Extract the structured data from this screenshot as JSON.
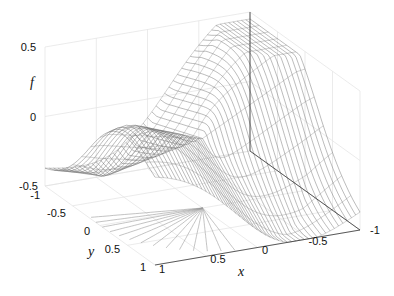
{
  "chart_data": {
    "type": "surface",
    "style": "mesh",
    "title": "",
    "xlabel": "x",
    "ylabel": "y",
    "zlabel": "f",
    "xlim": [
      -1,
      1
    ],
    "ylim": [
      -1,
      1
    ],
    "zlim": [
      -0.5,
      0.5
    ],
    "x_ticks": [
      "-1",
      "-0.5",
      "0",
      "0.5",
      "1"
    ],
    "y_ticks": [
      "-1",
      "-0.5",
      "0",
      "0.5",
      "1"
    ],
    "z_ticks": [
      "-0.5",
      "0",
      "0.5"
    ],
    "grid": true,
    "line_color": "#555555"
  },
  "labels": {
    "x": "x",
    "y": "y",
    "z": "f"
  },
  "ticks": {
    "z": [
      {
        "text": "0.5",
        "x": 36,
        "y": 51
      },
      {
        "text": "0",
        "x": 36,
        "y": 121
      },
      {
        "text": "-0.5",
        "x": 38,
        "y": 190
      }
    ],
    "y": [
      {
        "text": "-1",
        "x": 40,
        "y": 199
      },
      {
        "text": "-0.5",
        "x": 66,
        "y": 217
      },
      {
        "text": "0",
        "x": 90,
        "y": 235
      },
      {
        "text": "0.5",
        "x": 120,
        "y": 253
      },
      {
        "text": "1",
        "x": 146,
        "y": 271
      }
    ],
    "x": [
      {
        "text": "1",
        "x": 162,
        "y": 273
      },
      {
        "text": "0.5",
        "x": 218,
        "y": 263
      },
      {
        "text": "0",
        "x": 265,
        "y": 254
      },
      {
        "text": "-0.5",
        "x": 318,
        "y": 245
      },
      {
        "text": "-1",
        "x": 375,
        "y": 234
      }
    ]
  }
}
